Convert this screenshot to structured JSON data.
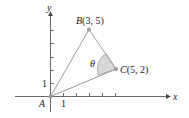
{
  "figure": {
    "axes": {
      "x_label": "x",
      "y_label": "y",
      "x_tick_label": "1",
      "y_tick_label": "1"
    },
    "points": {
      "A": {
        "label": "A",
        "coords": [
          0,
          0
        ]
      },
      "B": {
        "label": "B(3, 5)",
        "name": "B",
        "coords_text": "(3, 5)",
        "coords": [
          3,
          5
        ]
      },
      "C": {
        "label": "C(5, 2)",
        "name": "C",
        "coords_text": "(5, 2)",
        "coords": [
          5,
          2
        ]
      }
    },
    "angle": {
      "label": "θ",
      "vertex": "C"
    },
    "colors": {
      "lines": "#9a9a9a",
      "axes": "#444444",
      "points": "#9a9a9a",
      "arc_fill": "#d8d8d8"
    }
  }
}
